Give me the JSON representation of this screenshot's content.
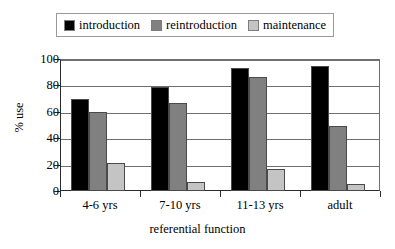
{
  "chart_data": {
    "type": "bar",
    "title": "",
    "xlabel": "referential function",
    "ylabel": "% use",
    "ylim": [
      0,
      100
    ],
    "ytick_values": [
      0,
      20,
      40,
      60,
      80,
      100
    ],
    "ytick_labels": [
      "0",
      "20",
      "40",
      "60",
      "80",
      "100"
    ],
    "grid": true,
    "legend_position": "top",
    "categories": [
      "4-6 yrs",
      "7-10 yrs",
      "11-13 yrs",
      "adult"
    ],
    "series": [
      {
        "name": "introduction",
        "color": "#000000",
        "values": [
          70,
          79,
          93,
          95
        ]
      },
      {
        "name": "reintroduction",
        "color": "#808080",
        "values": [
          60,
          67,
          86,
          49
        ]
      },
      {
        "name": "maintenance",
        "color": "#c4c4c4",
        "values": [
          21,
          7,
          17,
          5
        ]
      }
    ]
  },
  "legend": {
    "items": [
      {
        "label": "introduction"
      },
      {
        "label": "reintroduction"
      },
      {
        "label": "maintenance"
      }
    ]
  }
}
